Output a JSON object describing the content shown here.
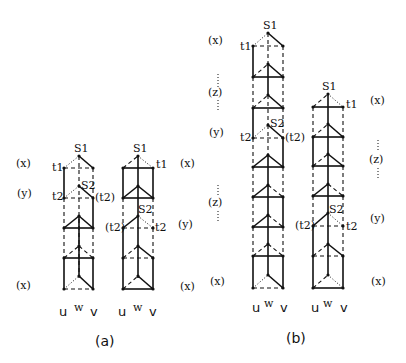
{
  "figure": {
    "panels": [
      {
        "caption": "(a)",
        "side_labels_left": [
          "(x)",
          "(y)",
          "(x)"
        ],
        "side_labels_right": [
          "(x)",
          "(y)",
          "(x)"
        ],
        "columns": [
          {
            "top_label": "S1",
            "mid_label": "S2",
            "t1_label": "t1",
            "t2_left": "t2",
            "t2_right": "(t2)",
            "bottom_labels": [
              "u",
              "w",
              "v"
            ]
          },
          {
            "top_label": "S1",
            "mid_label": "S2",
            "t1_label": "t1",
            "t2_left": "(t2)",
            "t2_right": "t2",
            "bottom_labels": [
              "u",
              "w",
              "v"
            ]
          }
        ]
      },
      {
        "caption": "(b)",
        "side_labels_left": [
          "(x)",
          "(z)",
          "(y)",
          "(z)",
          "(x)"
        ],
        "side_labels_right": [
          "(x)",
          "(z)",
          "(y)",
          "(x)"
        ],
        "columns": [
          {
            "top_label": "S1",
            "mid_label": "S2",
            "t1_label": "t1",
            "t2_left": "t2",
            "t2_right": "(t2)",
            "bottom_labels": [
              "u",
              "w",
              "v"
            ]
          },
          {
            "top_label": "S1",
            "mid_label": "S2",
            "t1_label": "t1",
            "t2_left": "(t2)",
            "t2_right": "t2",
            "bottom_labels": [
              "u",
              "w",
              "v"
            ]
          }
        ]
      }
    ]
  }
}
